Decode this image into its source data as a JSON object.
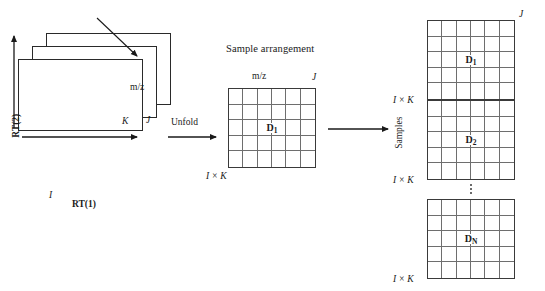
{
  "figure": {
    "type": "diagram",
    "background_color": "#ffffff",
    "line_color": "#3a3a3a",
    "grid_line_color": "#6e6e6e"
  },
  "left_block": {
    "name": "three-way-data-cube",
    "slab_count": 3,
    "axes": {
      "vertical_label": "RT(2)",
      "horizontal_label": "RT(1)",
      "depth_label": "m/z"
    },
    "dimension_labels": {
      "rows": "I",
      "depth": "K",
      "columns": "J"
    }
  },
  "transform": {
    "unfold_label": "Unfold"
  },
  "middle_block": {
    "title": "Sample arrangement",
    "top_axis_label": "m/z",
    "top_right_dim": "J",
    "bottom_left_dim": "I × K",
    "matrix_label": "D",
    "matrix_subscript": "1",
    "columns": 6,
    "rows": 5
  },
  "right_block": {
    "side_axis_label": "Samples",
    "top_right_dim": "J",
    "blocks": [
      {
        "label": "D",
        "subscript": "1",
        "left_dim": "I × K",
        "columns": 6,
        "rows": 5
      },
      {
        "label": "D",
        "subscript": "2",
        "left_dim": "I × K",
        "columns": 6,
        "rows": 5
      },
      {
        "label": "D",
        "subscript": "N",
        "left_dim": "I × K",
        "columns": 6,
        "rows": 5
      }
    ],
    "continuation_marker": "vertical-ellipsis"
  }
}
